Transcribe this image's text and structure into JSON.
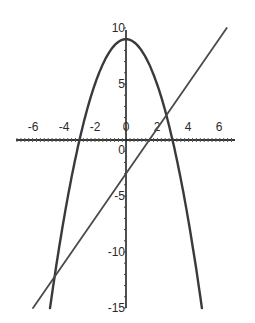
{
  "chart_data": {
    "type": "line",
    "title": "",
    "xlabel": "",
    "ylabel": "",
    "xlim": [
      -7,
      7
    ],
    "ylim": [
      -15,
      10
    ],
    "grid": false,
    "legend": null,
    "x_ticks": [
      -6,
      -4,
      -2,
      0,
      2,
      4,
      6
    ],
    "y_ticks": [
      10,
      5,
      0,
      -5,
      -10,
      -15
    ],
    "x_tick_labels": [
      "-6",
      "-4",
      "-2",
      "0",
      "2",
      "4",
      "6"
    ],
    "y_tick_labels": [
      "10",
      "5",
      "0",
      "-5",
      "-10",
      "-15"
    ],
    "series": [
      {
        "name": "parabola",
        "equation": "y = 9 - x^2",
        "x": [
          -4.9,
          -4,
          -3,
          -2,
          -1,
          0,
          1,
          2,
          3,
          4,
          4.9
        ],
        "y": [
          -15,
          -7,
          0,
          5,
          8,
          9,
          8,
          5,
          0,
          -7,
          -15
        ]
      },
      {
        "name": "line",
        "equation": "y = 2x - 3",
        "x": [
          -6,
          -3,
          0,
          1.5,
          3,
          6.5
        ],
        "y": [
          -15,
          -9,
          -3,
          0,
          3,
          10
        ]
      }
    ],
    "intersections": [
      [
        -6,
        -15
      ],
      [
        2,
        5
      ]
    ]
  }
}
